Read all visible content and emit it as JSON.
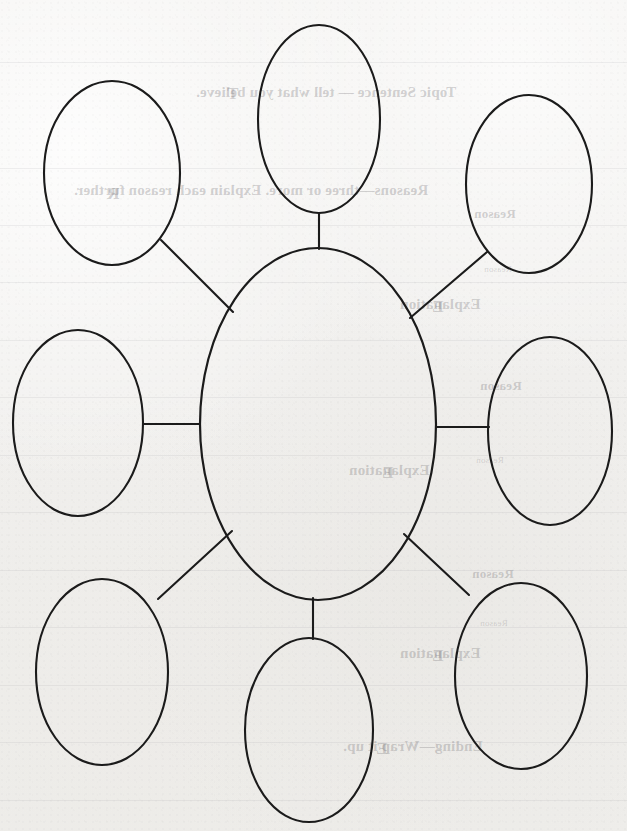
{
  "document": {
    "type": "worksheet",
    "title": "Spider Web Graphic Organizer",
    "paper_color": "#f2f1ef",
    "ink_color": "#1b1b1b"
  },
  "diagram": {
    "name": "spider-web-graphic-organizer",
    "shape": "ellipse",
    "center_node": {
      "label": "",
      "cx": 318,
      "cy": 424,
      "rx": 118,
      "ry": 176
    },
    "satellite_nodes": [
      {
        "id": "top",
        "label": "",
        "cx": 319,
        "cy": 119,
        "rx": 61,
        "ry": 94
      },
      {
        "id": "top-left",
        "label": "",
        "cx": 112,
        "cy": 173,
        "rx": 68,
        "ry": 92
      },
      {
        "id": "top-right",
        "label": "",
        "cx": 529,
        "cy": 184,
        "rx": 63,
        "ry": 89
      },
      {
        "id": "left",
        "label": "",
        "cx": 78,
        "cy": 423,
        "rx": 65,
        "ry": 93
      },
      {
        "id": "right",
        "label": "",
        "cx": 550,
        "cy": 431,
        "rx": 62,
        "ry": 94
      },
      {
        "id": "bottom-left",
        "label": "",
        "cx": 102,
        "cy": 672,
        "rx": 66,
        "ry": 93
      },
      {
        "id": "bottom",
        "label": "",
        "cx": 309,
        "cy": 730,
        "rx": 64,
        "ry": 92
      },
      {
        "id": "bottom-right",
        "label": "",
        "cx": 521,
        "cy": 676,
        "rx": 66,
        "ry": 93
      }
    ],
    "connectors": [
      {
        "id": "connector-top",
        "x1": 319,
        "y1": 213,
        "x2": 319,
        "y2": 249
      },
      {
        "id": "connector-top-left",
        "x1": 161,
        "y1": 240,
        "x2": 233,
        "y2": 312
      },
      {
        "id": "connector-top-right",
        "x1": 487,
        "y1": 252,
        "x2": 410,
        "y2": 318
      },
      {
        "id": "connector-left",
        "x1": 143,
        "y1": 424,
        "x2": 200,
        "y2": 424
      },
      {
        "id": "connector-right",
        "x1": 436,
        "y1": 427,
        "x2": 489,
        "y2": 427
      },
      {
        "id": "connector-bottom-left",
        "x1": 158,
        "y1": 599,
        "x2": 232,
        "y2": 531
      },
      {
        "id": "connector-bottom",
        "x1": 313,
        "y1": 598,
        "x2": 313,
        "y2": 639
      },
      {
        "id": "connector-bottom-right",
        "x1": 469,
        "y1": 595,
        "x2": 404,
        "y2": 534
      }
    ]
  },
  "bleed_through": {
    "note": "Faint mirrored text showing through from the reverse side of the page.",
    "lines": [
      {
        "id": "topic-sentence",
        "text": "Topic Sentence — tell what you believe.",
        "x": 196,
        "y": 84,
        "size": 15
      },
      {
        "id": "reasons",
        "text": "Reasons—three or more. Explain each reason further.",
        "x": 74,
        "y": 182,
        "size": 15
      },
      {
        "id": "reason-1",
        "text": "Reason",
        "x": 474,
        "y": 206,
        "size": 13
      },
      {
        "id": "reason-tag-1",
        "text": "Reason",
        "x": 484,
        "y": 264,
        "size": 9
      },
      {
        "id": "explanation-1",
        "text": "Explanation",
        "x": 400,
        "y": 296,
        "size": 15
      },
      {
        "id": "reason-2",
        "text": "Reason",
        "x": 480,
        "y": 378,
        "size": 13
      },
      {
        "id": "reason-tag-2",
        "text": "Reason",
        "x": 476,
        "y": 455,
        "size": 9
      },
      {
        "id": "explanation-2",
        "text": "Explanation",
        "x": 349,
        "y": 462,
        "size": 15
      },
      {
        "id": "reason-3",
        "text": "Reason",
        "x": 472,
        "y": 566,
        "size": 13
      },
      {
        "id": "reason-tag-3",
        "text": "Reason",
        "x": 480,
        "y": 618,
        "size": 9
      },
      {
        "id": "explanation-3",
        "text": "Explanation",
        "x": 400,
        "y": 645,
        "size": 15
      },
      {
        "id": "ending",
        "text": "Ending—Wrap it up.",
        "x": 343,
        "y": 738,
        "size": 15
      }
    ],
    "margin_marks": [
      {
        "id": "mark-top",
        "text": "T",
        "x": 227,
        "y": 84,
        "size": 17
      },
      {
        "id": "mark-reasons",
        "text": "R",
        "x": 107,
        "y": 184,
        "size": 17
      },
      {
        "id": "mark-exp-1",
        "text": "E",
        "x": 432,
        "y": 297,
        "size": 17
      },
      {
        "id": "mark-exp-2",
        "text": "E",
        "x": 382,
        "y": 463,
        "size": 17
      },
      {
        "id": "mark-exp-3",
        "text": "E",
        "x": 432,
        "y": 646,
        "size": 17
      },
      {
        "id": "mark-ending",
        "text": "E",
        "x": 376,
        "y": 739,
        "size": 17
      }
    ],
    "rules_y": [
      62,
      168,
      225,
      282,
      340,
      397,
      455,
      512,
      570,
      627,
      685,
      742,
      800
    ]
  }
}
